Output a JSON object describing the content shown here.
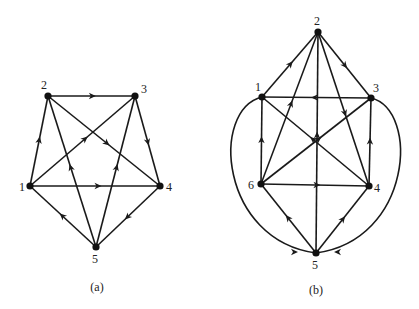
{
  "graphs": [
    {
      "id": "a",
      "caption": "(a)",
      "caption_pos": [
        97,
        291
      ],
      "nodes": [
        {
          "id": "1",
          "label": "1",
          "x": 30,
          "y": 186,
          "lx": 19,
          "ly": 191
        },
        {
          "id": "2",
          "label": "2",
          "x": 48,
          "y": 96,
          "lx": 41,
          "ly": 89
        },
        {
          "id": "3",
          "label": "3",
          "x": 135,
          "y": 96,
          "lx": 141,
          "ly": 93
        },
        {
          "id": "4",
          "label": "4",
          "x": 160,
          "y": 186,
          "lx": 166,
          "ly": 191
        },
        {
          "id": "5",
          "label": "5",
          "x": 96,
          "y": 247,
          "lx": 92,
          "ly": 263
        }
      ],
      "edges": [
        {
          "from": "1",
          "to": "2"
        },
        {
          "from": "2",
          "to": "3"
        },
        {
          "from": "1",
          "to": "3"
        },
        {
          "from": "2",
          "to": "4"
        },
        {
          "from": "3",
          "to": "4"
        },
        {
          "from": "1",
          "to": "4"
        },
        {
          "from": "4",
          "to": "5"
        },
        {
          "from": "5",
          "to": "1"
        },
        {
          "from": "5",
          "to": "2"
        },
        {
          "from": "5",
          "to": "3"
        }
      ]
    },
    {
      "id": "b",
      "caption": "(b)",
      "caption_pos": [
        316,
        294
      ],
      "nodes": [
        {
          "id": "1",
          "label": "1",
          "x": 262,
          "y": 97,
          "lx": 255,
          "ly": 91
        },
        {
          "id": "2",
          "label": "2",
          "x": 318,
          "y": 32,
          "lx": 314,
          "ly": 25
        },
        {
          "id": "3",
          "label": "3",
          "x": 371,
          "y": 98,
          "lx": 373,
          "ly": 92
        },
        {
          "id": "4",
          "label": "4",
          "x": 369,
          "y": 186,
          "lx": 374,
          "ly": 192
        },
        {
          "id": "5",
          "label": "5",
          "x": 316,
          "y": 253,
          "lx": 312,
          "ly": 269
        },
        {
          "id": "6",
          "label": "6",
          "x": 261,
          "y": 184,
          "lx": 248,
          "ly": 189
        }
      ],
      "edges": [
        {
          "from": "1",
          "to": "2"
        },
        {
          "from": "2",
          "to": "3"
        },
        {
          "from": "3",
          "to": "1"
        },
        {
          "from": "6",
          "to": "1"
        },
        {
          "from": "4",
          "to": "3"
        },
        {
          "from": "6",
          "to": "3"
        },
        {
          "from": "4",
          "to": "1"
        },
        {
          "from": "6",
          "to": "4"
        },
        {
          "from": "6",
          "to": "2"
        },
        {
          "from": "5",
          "to": "2"
        },
        {
          "from": "2",
          "to": "4"
        },
        {
          "from": "5",
          "to": "6"
        },
        {
          "from": "5",
          "to": "4"
        }
      ],
      "curved_edges": [
        {
          "from": "1",
          "to": "5",
          "path": "M262,97 C210,110 220,240 316,253",
          "arrow_at": [
            298,
            252
          ],
          "arrow_angle": 0
        },
        {
          "from": "3",
          "to": "5",
          "path": "M371,98 C420,110 412,240 316,253",
          "arrow_at": [
            334,
            252
          ],
          "arrow_angle": 180
        }
      ]
    }
  ]
}
